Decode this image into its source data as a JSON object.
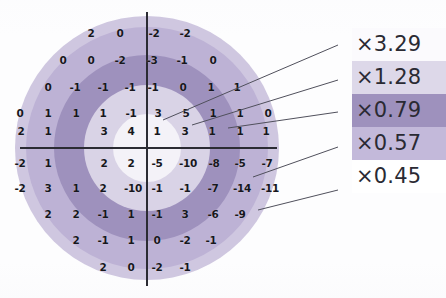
{
  "figure": {
    "type": "polar-zone-residual-map",
    "center": {
      "x": 147,
      "y": 148
    },
    "axes": {
      "horizontal": {
        "x1": 20,
        "x2": 277,
        "y": 148
      },
      "vertical": {
        "x": 147,
        "y1": 12,
        "y2": 286
      }
    },
    "rings": [
      {
        "name": "zone-1-core",
        "label": "×3.29",
        "radius": 34,
        "color": "#f4f2f8"
      },
      {
        "name": "zone-2",
        "label": "×1.28",
        "radius": 63,
        "color": "#d9d3e6"
      },
      {
        "name": "zone-3",
        "label": "×0.79",
        "radius": 93,
        "color": "#9e91bd"
      },
      {
        "name": "zone-4",
        "label": "×0.57",
        "radius": 121,
        "color": "#bdb2d5"
      },
      {
        "name": "zone-5-outer",
        "label": "×0.45",
        "radius": 132,
        "color": "#cfc7e0"
      }
    ],
    "grid": {
      "cell_w": 29,
      "cell_h": 27,
      "rows": [
        {
          "y": 33,
          "cells": [
            {
              "x": 91,
              "v": "2"
            },
            {
              "x": 120,
              "v": "0"
            },
            {
              "x": 154,
              "v": "-2"
            },
            {
              "x": 185,
              "v": "-2"
            }
          ]
        },
        {
          "y": 60,
          "cells": [
            {
              "x": 63,
              "v": "0"
            },
            {
              "x": 91,
              "v": "0"
            },
            {
              "x": 120,
              "v": "-2"
            },
            {
              "x": 152,
              "v": "-3"
            },
            {
              "x": 182,
              "v": "-1"
            },
            {
              "x": 213,
              "v": "0"
            }
          ]
        },
        {
          "y": 87,
          "cells": [
            {
              "x": 48,
              "v": "0"
            },
            {
              "x": 75,
              "v": "-1"
            },
            {
              "x": 103,
              "v": "-1"
            },
            {
              "x": 130,
              "v": "-1"
            },
            {
              "x": 153,
              "v": "-1"
            },
            {
              "x": 183,
              "v": "0"
            },
            {
              "x": 211,
              "v": "1"
            },
            {
              "x": 237,
              "v": "1"
            }
          ]
        },
        {
          "y": 113,
          "cells": [
            {
              "x": 20,
              "v": "0"
            },
            {
              "x": 48,
              "v": "1"
            },
            {
              "x": 76,
              "v": "1"
            },
            {
              "x": 103,
              "v": "1"
            },
            {
              "x": 131,
              "v": "-1"
            },
            {
              "x": 158,
              "v": "3"
            },
            {
              "x": 186,
              "v": "5"
            },
            {
              "x": 213,
              "v": "1"
            },
            {
              "x": 240,
              "v": "1"
            },
            {
              "x": 268,
              "v": "0"
            }
          ]
        },
        {
          "y": 131,
          "cells": [
            {
              "x": 21,
              "v": "2"
            },
            {
              "x": 48,
              "v": "1"
            },
            {
              "x": 104,
              "v": "3"
            },
            {
              "x": 131,
              "v": "4"
            },
            {
              "x": 157,
              "v": "1"
            },
            {
              "x": 185,
              "v": "3"
            },
            {
              "x": 212,
              "v": "1"
            },
            {
              "x": 240,
              "v": "1"
            },
            {
              "x": 266,
              "v": "1"
            }
          ]
        },
        {
          "y": 163,
          "cells": [
            {
              "x": 20,
              "v": "-2"
            },
            {
              "x": 48,
              "v": "1"
            },
            {
              "x": 104,
              "v": "2"
            },
            {
              "x": 131,
              "v": "2"
            },
            {
              "x": 157,
              "v": "-5"
            },
            {
              "x": 188,
              "v": "-10"
            },
            {
              "x": 214,
              "v": "-8"
            },
            {
              "x": 240,
              "v": "-5"
            },
            {
              "x": 267,
              "v": "-7"
            }
          ]
        },
        {
          "y": 188,
          "cells": [
            {
              "x": 20,
              "v": "-2"
            },
            {
              "x": 48,
              "v": "3"
            },
            {
              "x": 76,
              "v": "1"
            },
            {
              "x": 103,
              "v": "2"
            },
            {
              "x": 133,
              "v": "-10"
            },
            {
              "x": 157,
              "v": "-1"
            },
            {
              "x": 185,
              "v": "-1"
            },
            {
              "x": 213,
              "v": "-7"
            },
            {
              "x": 242,
              "v": "-14"
            },
            {
              "x": 270,
              "v": "-11"
            }
          ]
        },
        {
          "y": 214,
          "cells": [
            {
              "x": 48,
              "v": "2"
            },
            {
              "x": 76,
              "v": "2"
            },
            {
              "x": 103,
              "v": "-1"
            },
            {
              "x": 131,
              "v": "1"
            },
            {
              "x": 157,
              "v": "-1"
            },
            {
              "x": 185,
              "v": "3"
            },
            {
              "x": 213,
              "v": "-6"
            },
            {
              "x": 240,
              "v": "-9"
            }
          ]
        },
        {
          "y": 240,
          "cells": [
            {
              "x": 76,
              "v": "2"
            },
            {
              "x": 103,
              "v": "-1"
            },
            {
              "x": 131,
              "v": "1"
            },
            {
              "x": 157,
              "v": "0"
            },
            {
              "x": 185,
              "v": "-2"
            },
            {
              "x": 211,
              "v": "-1"
            }
          ]
        },
        {
          "y": 267,
          "cells": [
            {
              "x": 103,
              "v": "2"
            },
            {
              "x": 131,
              "v": "0"
            },
            {
              "x": 157,
              "v": "-2"
            },
            {
              "x": 185,
              "v": "-1"
            }
          ]
        }
      ]
    },
    "legend": {
      "x": 352,
      "items": [
        {
          "name": "legend-swatch-3-29",
          "label": "×3.29",
          "swatch": "#fbfafd",
          "leader": {
            "x1": 338,
            "y1": 45,
            "x2": 163,
            "y2": 120
          }
        },
        {
          "name": "legend-swatch-1-28",
          "label": "×1.28",
          "swatch": "#ddd8e9",
          "leader": {
            "x1": 338,
            "y1": 80,
            "x2": 192,
            "y2": 125
          }
        },
        {
          "name": "legend-swatch-0-79",
          "label": "×0.79",
          "swatch": "#9e91bd",
          "leader": {
            "x1": 338,
            "y1": 112,
            "x2": 228,
            "y2": 128
          }
        },
        {
          "name": "legend-swatch-0-57",
          "label": "×0.57",
          "swatch": "#c3b9da",
          "leader": {
            "x1": 338,
            "y1": 147,
            "x2": 253,
            "y2": 177
          }
        },
        {
          "name": "legend-swatch-0-45",
          "label": "×0.45",
          "swatch": "#ffffff",
          "leader": {
            "x1": 338,
            "y1": 190,
            "x2": 258,
            "y2": 210
          }
        }
      ]
    }
  },
  "chart_data": {
    "type": "heatmap",
    "title": "",
    "xlabel": "",
    "ylabel": "",
    "grid_note": "Values are integer residuals placed on a cartesian grid centred on the crosshair.",
    "zone_multipliers": [
      3.29,
      1.28,
      0.79,
      0.57,
      0.45
    ],
    "rows": [
      [
        "",
        "",
        "",
        "2",
        "0",
        "-2",
        "-2",
        "",
        "",
        ""
      ],
      [
        "",
        "0",
        "0",
        "-2",
        "-3",
        "-1",
        "0",
        "",
        "",
        ""
      ],
      [
        "0",
        "-1",
        "-1",
        "-1",
        "-1",
        "0",
        "1",
        "1",
        "",
        ""
      ],
      [
        "0",
        "1",
        "1",
        "1",
        "-1",
        "3",
        "5",
        "1",
        "1",
        "0"
      ],
      [
        "2",
        "1",
        "",
        "3",
        "4",
        "1",
        "3",
        "1",
        "1",
        "1"
      ],
      [
        "-2",
        "1",
        "",
        "2",
        "2",
        "-5",
        "-10",
        "-8",
        "-5",
        "-7"
      ],
      [
        "-2",
        "3",
        "1",
        "2",
        "-10",
        "-1",
        "-1",
        "-7",
        "-14",
        "-11"
      ],
      [
        "",
        "2",
        "2",
        "-1",
        "1",
        "-1",
        "3",
        "-6",
        "-9",
        ""
      ],
      [
        "",
        "",
        "2",
        "-1",
        "1",
        "0",
        "-2",
        "-1",
        "",
        ""
      ],
      [
        "",
        "",
        "",
        "2",
        "0",
        "-2",
        "-1",
        "",
        "",
        ""
      ]
    ]
  }
}
